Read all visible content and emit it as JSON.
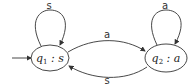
{
  "diagram": {
    "type": "state-machine",
    "states": [
      {
        "id": "q1",
        "name": "q",
        "subscript": "1",
        "output": "s",
        "initial": true
      },
      {
        "id": "q2",
        "name": "q",
        "subscript": "2",
        "output": "a",
        "initial": false
      }
    ],
    "transitions": [
      {
        "from": "q1",
        "to": "q1",
        "label": "s"
      },
      {
        "from": "q1",
        "to": "q2",
        "label": "a"
      },
      {
        "from": "q2",
        "to": "q1",
        "label": "s"
      },
      {
        "from": "q2",
        "to": "q2",
        "label": "a"
      }
    ],
    "separator": ":"
  }
}
